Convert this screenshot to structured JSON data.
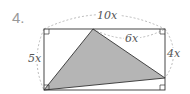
{
  "problem_number": "4.",
  "labels": {
    "top_width": "10x",
    "top_segment": "6x",
    "left_height": "5x",
    "right_segment": "4x"
  },
  "colors": {
    "shaded_fill": "#b5b5b5",
    "outline": "#333333",
    "dashed": "#aaaaaa"
  }
}
